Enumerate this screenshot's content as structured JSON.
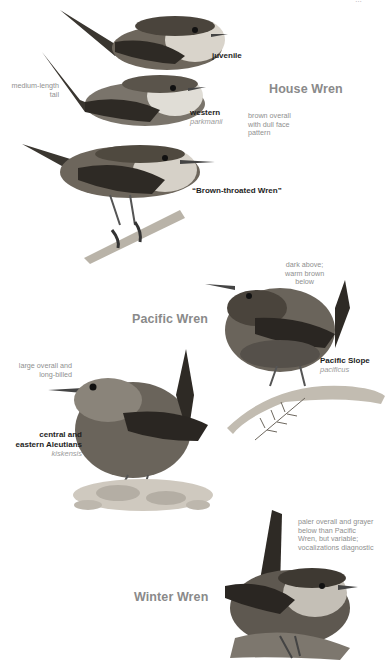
{
  "page": {
    "corner_fragment": "…"
  },
  "house_wren": {
    "title": "House Wren",
    "description": [
      "brown overall",
      "with dull face",
      "pattern"
    ],
    "tail_note": [
      "medium-length",
      "tail"
    ],
    "forms": [
      {
        "label": "juvenile",
        "sci": ""
      },
      {
        "label": "western",
        "sci": "parkmanii"
      },
      {
        "label": "“Brown-throated Wren”",
        "sci": ""
      }
    ]
  },
  "pacific_wren": {
    "title": "Pacific Wren",
    "forms": [
      {
        "label": "Pacific Slope",
        "sci": "pacificus",
        "note": [
          "dark above;",
          "warm brown",
          "below"
        ]
      },
      {
        "label_lines": [
          "central and",
          "eastern Aleutians"
        ],
        "sci": "kiskensis",
        "note": [
          "large overall and",
          "long-billed"
        ]
      }
    ]
  },
  "winter_wren": {
    "title": "Winter Wren",
    "note": [
      "paler overall and grayer",
      "below than Pacific",
      "Wren, but variable;",
      "vocalizations diagnostic"
    ]
  },
  "colors": {
    "species_heading": "#8a8a8a",
    "annotation": "#8f8f8f",
    "label": "#1e1e1e",
    "bird_dark": "#3a3630",
    "bird_mid": "#7a746b",
    "bird_light": "#c9c4bb"
  }
}
